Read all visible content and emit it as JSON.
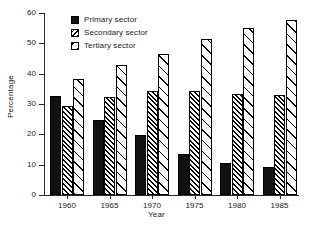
{
  "chart_data": {
    "type": "bar",
    "title": "",
    "subtitle": "",
    "xlabel": "Year",
    "ylabel": "Percentage",
    "categories": [
      "1960",
      "1965",
      "1970",
      "1975",
      "1980",
      "1985"
    ],
    "series": [
      {
        "name": "Primary sector",
        "pattern": "solid-black",
        "values": [
          32.7,
          24.8,
          19.9,
          13.5,
          10.7,
          9.1
        ]
      },
      {
        "name": "Secondary sector",
        "pattern": "dense-diagonal-hatch",
        "values": [
          29.3,
          32.2,
          34.2,
          34.2,
          33.3,
          33.0
        ]
      },
      {
        "name": "Tertiary sector",
        "pattern": "sparse-diagonal-hatch",
        "values": [
          38.2,
          43.0,
          46.4,
          51.4,
          55.1,
          57.6
        ]
      }
    ],
    "ylim": [
      0,
      60
    ],
    "yticks": [
      0,
      10,
      20,
      30,
      40,
      50,
      60
    ],
    "ytick_labels": [
      "0",
      "10",
      "20",
      "30",
      "40",
      "50",
      "60"
    ],
    "grid": false,
    "legend_position": "top-left-inside"
  },
  "legend": {
    "items": [
      {
        "label": "Primary sector"
      },
      {
        "label": "Secondary sector"
      },
      {
        "label": "Tertiary sector"
      }
    ]
  },
  "colors": {
    "primary": "#111111",
    "hatch": "#000000",
    "background": "#ffffff",
    "axis": "#2a2a2a",
    "text": "#1a1a1a"
  }
}
